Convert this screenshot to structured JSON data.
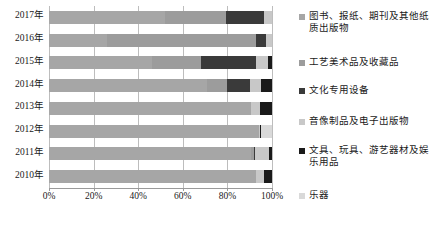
{
  "chart_data": {
    "type": "bar",
    "orientation": "horizontal",
    "stacked": true,
    "normalized": "100%",
    "title": "",
    "xlabel": "",
    "ylabel": "",
    "xlim": [
      0,
      100
    ],
    "xticks": [
      0,
      20,
      40,
      60,
      80,
      100
    ],
    "xticklabels": [
      "0%",
      "20%",
      "40%",
      "60%",
      "80%",
      "100%"
    ],
    "grid": true,
    "grid_axis": "x",
    "legend_position": "right",
    "categories": [
      "2017年",
      "2016年",
      "2015年",
      "2014年",
      "2013年",
      "2012年",
      "2011年",
      "2010年"
    ],
    "series": [
      {
        "name": "图书、报纸、期刊及其他纸质出版物",
        "color": "#a6a6a6",
        "values": [
          52.0,
          26.0,
          46.0,
          71.0,
          90.5,
          94.0,
          90.5,
          93.0
        ]
      },
      {
        "name": "工艺美术品及收藏品",
        "color": "#9c9c9c",
        "values": [
          27.5,
          67.0,
          22.0,
          9.0,
          0.0,
          0.0,
          1.5,
          0.0
        ]
      },
      {
        "name": "文化专用设备",
        "color": "#3a3a3a",
        "values": [
          17.0,
          4.5,
          25.0,
          10.0,
          0.0,
          0.3,
          0.5,
          0.0
        ]
      },
      {
        "name": "音像制品及电子出版物",
        "color": "#c8c8c8",
        "values": [
          3.5,
          2.5,
          5.0,
          5.0,
          4.0,
          0.5,
          6.0,
          3.5
        ]
      },
      {
        "name": "文具、玩具、游艺器材及娱乐用品",
        "color": "#1a1a1a",
        "values": [
          0.0,
          0.0,
          2.0,
          5.0,
          5.5,
          0.4,
          1.5,
          3.5
        ]
      },
      {
        "name": "乐器",
        "color": "#d9d9d9",
        "values": [
          0.0,
          0.0,
          0.0,
          0.0,
          0.0,
          4.8,
          0.0,
          0.0
        ]
      }
    ]
  }
}
